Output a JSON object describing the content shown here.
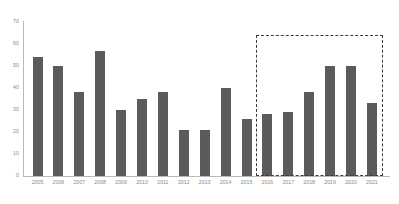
{
  "chart_data": {
    "type": "bar",
    "title": "",
    "subtitle": "",
    "xlabel": "",
    "ylabel": "",
    "ylim": [
      0,
      70
    ],
    "yticks": [
      0,
      10,
      20,
      30,
      40,
      50,
      60,
      70
    ],
    "grid": false,
    "legend": null,
    "bar_color": "#5b5b5b",
    "axis_color": "#b9b9b9",
    "tick_label_color": "#8a8a8a",
    "categories": [
      "2005",
      "2006",
      "2007",
      "2008",
      "2009",
      "2010",
      "2011",
      "2012",
      "2013",
      "2014",
      "2015",
      "2016",
      "2017",
      "2018",
      "2019",
      "2020",
      "2021"
    ],
    "values": [
      54,
      50,
      38,
      57,
      30,
      35,
      38,
      21,
      21,
      40,
      26,
      28,
      29,
      38,
      50,
      50,
      33
    ],
    "annotations": [
      {
        "name": "highlight-region",
        "style": "dashed-rectangle",
        "color": "#3b3b3b",
        "covers_categories": [
          "2016",
          "2017",
          "2018",
          "2019",
          "2020",
          "2021"
        ],
        "y_range": [
          0,
          64
        ]
      }
    ]
  }
}
